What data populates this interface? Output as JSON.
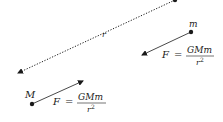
{
  "diagram": {
    "distance_label": "r",
    "bodies": [
      {
        "label": "M",
        "role": "large mass"
      },
      {
        "label": "m",
        "role": "small mass"
      }
    ],
    "force_equation": {
      "lhs": "F",
      "equals": "=",
      "numerator": "GMm",
      "denominator_base": "r",
      "denominator_exp": "2"
    },
    "colors": {
      "ink": "#1a1a1a",
      "background": "#ffffff"
    }
  }
}
